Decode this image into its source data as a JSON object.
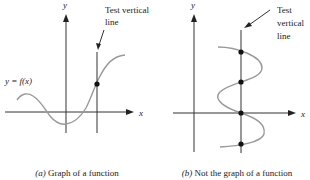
{
  "figure": {
    "panel_a": {
      "axis_labels": {
        "x": "x",
        "y": "y"
      },
      "function_label": "y = f(x)",
      "annotation_line1": "Test vertical",
      "annotation_line2": "line",
      "caption_letter": "(a)",
      "caption_text": " Graph of a function",
      "intersection_count": 1
    },
    "panel_b": {
      "axis_labels": {
        "x": "x",
        "y": "y"
      },
      "annotation_line1": "Test",
      "annotation_line2": "vertical",
      "annotation_line3": "line",
      "caption_letter": "(b)",
      "caption_text": " Not the graph of a function",
      "intersection_count": 4
    },
    "colors": {
      "axes": "#333333",
      "curve": "#9a9a9a",
      "dots": "#111111",
      "background": "#ffffff"
    }
  }
}
